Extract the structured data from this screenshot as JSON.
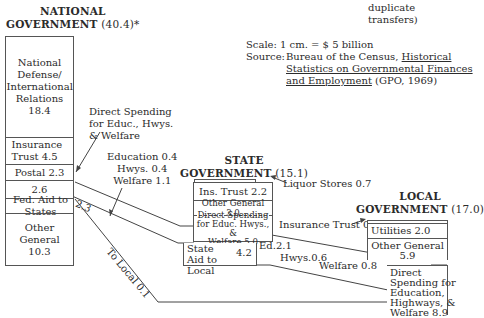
{
  "national": {
    "title_line1": "NATIONAL",
    "title_line2": "GOVERNMENT",
    "total": "(40.4)*",
    "cells": [
      {
        "label": "National Defense/ International Relations",
        "value": "18.4"
      },
      {
        "label": "Insurance Trust 4.5"
      },
      {
        "label": "Postal 2.3"
      },
      {
        "label": "2.6"
      },
      {
        "label": "Fed. Aid to States"
      },
      {
        "label": "Other General",
        "value": "10.3"
      }
    ],
    "aid_value": "2.3"
  },
  "state": {
    "title_line1": "STATE",
    "title_line2": "GOVERNMENT",
    "total": "(15.1)",
    "cells": [
      {
        "label": "Ins. Trust 2.2"
      },
      {
        "label": "Other General 3.0"
      },
      {
        "label": "Direct Spending for Educ. Hwys., &",
        "value": "Welfare 5.0"
      },
      {
        "label": "State Aid to Local",
        "value": "4.2"
      }
    ]
  },
  "local": {
    "title_line1": "LOCAL",
    "title_line2": "GOVERNMENT",
    "total": "(17.0)",
    "cells": [
      {
        "label": "Utilities 2.0"
      },
      {
        "label": "Other General",
        "value": "5.9"
      },
      {
        "label": "Direct Spending for Education, Highways, &",
        "value": "Welfare 8.9"
      }
    ]
  },
  "annotations": {
    "fed_direct_line1": "Direct Spending",
    "fed_direct_line2": "for Educ., Hwys.",
    "fed_direct_line3": "& Welfare",
    "fed_aid_line1": "Education 0.4",
    "fed_aid_line2": "Hwys. 0.4",
    "fed_aid_line3": "Welfare 1.1",
    "to_local": "To Local 0.1",
    "liquor": "Liquor Stores 0.7",
    "insurance_trust_local": "Insurance Trust 0.2",
    "state_ed": "Ed.2.1",
    "state_hwys": "Hwys.0.6",
    "state_welfare": "Welfare 0.8"
  },
  "notes": {
    "duplicate_line1": "duplicate",
    "duplicate_line2": "transfers)",
    "scale": "Scale: 1 cm. = $ 5 billion",
    "source_label": "Source:",
    "source_text": "Bureau of the Census,",
    "source_title_1": "Historical",
    "source_title_2": "Statistics on Governmental Finances",
    "source_title_3": "and Employment",
    "source_pub": "(GPO, 1969)"
  },
  "colors": {
    "ink": "#2b2b2b",
    "line": "#555555",
    "background": "#ffffff"
  }
}
